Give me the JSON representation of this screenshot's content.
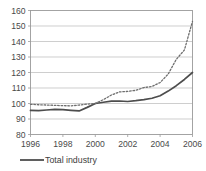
{
  "chart_data": {
    "type": "line",
    "title": "",
    "subtitle": "",
    "xlabel": "",
    "ylabel": "",
    "xlim": [
      1996,
      2006
    ],
    "ylim": [
      80,
      160
    ],
    "grid": true,
    "legend_position": "bottom-left",
    "y_ticks": [
      80,
      90,
      100,
      110,
      120,
      130,
      140,
      150,
      160
    ],
    "y_tick_labels": [
      "80",
      "90",
      "100",
      "110",
      "120",
      "130",
      "140",
      "150",
      "160"
    ],
    "x_ticks": [
      1996,
      1998,
      2000,
      2002,
      2004,
      2006
    ],
    "x_tick_labels": [
      "1996",
      "1998",
      "2000",
      "2002",
      "2004",
      "2006"
    ],
    "x": [
      1996,
      1996.5,
      1997,
      1997.5,
      1998,
      1998.5,
      1999,
      1999.5,
      2000,
      2000.5,
      2001,
      2001.5,
      2002,
      2002.5,
      2003,
      2003.5,
      2004,
      2004.5,
      2005,
      2005.5,
      2006
    ],
    "series": [
      {
        "name": "Total industry",
        "style": "solid",
        "color": "#4d4d4d",
        "in_legend": true,
        "values": [
          95.5,
          95.4,
          95.8,
          96.2,
          96.0,
          95.6,
          95.2,
          97.5,
          100.0,
          100.8,
          101.5,
          101.6,
          101.3,
          101.8,
          102.5,
          103.4,
          105.0,
          108.0,
          111.5,
          115.5,
          120.0
        ]
      },
      {
        "name": "",
        "style": "dotted",
        "color": "#6e6e6e",
        "in_legend": false,
        "values": [
          99.5,
          99.2,
          99.0,
          98.8,
          98.6,
          98.5,
          99.0,
          99.6,
          100.0,
          102.5,
          105.5,
          107.5,
          107.8,
          108.5,
          110.3,
          111.0,
          113.5,
          119.0,
          128.5,
          134.5,
          153.0
        ]
      }
    ],
    "legend": [
      {
        "label": "Total industry",
        "style": "solid",
        "color": "#4d4d4d"
      }
    ]
  }
}
